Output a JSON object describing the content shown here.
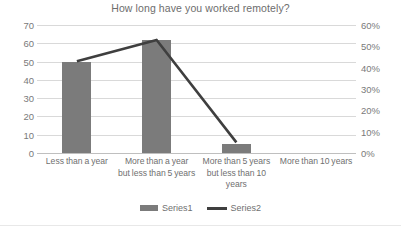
{
  "chart_data": {
    "type": "bar",
    "title": "How long have you worked remotely?",
    "xlabel": "",
    "ylabel": "",
    "categories": [
      "Less than a year",
      "More than a year but less than 5 years",
      "More than 5 years but less than 10 years",
      "More than 10 years"
    ],
    "series": [
      {
        "name": "Series1",
        "type": "bar",
        "axis": "left",
        "values": [
          50,
          62,
          5,
          0
        ]
      },
      {
        "name": "Series2",
        "type": "line",
        "axis": "right",
        "values": [
          43,
          53,
          5,
          null
        ]
      }
    ],
    "ylim": [
      0,
      70
    ],
    "y_ticks": [
      "0",
      "10",
      "20",
      "30",
      "40",
      "50",
      "60",
      "70"
    ],
    "y2lim": [
      0,
      60
    ],
    "y2_ticks": [
      "0%",
      "10%",
      "20%",
      "30%",
      "40%",
      "50%",
      "60%"
    ],
    "grid": true,
    "legend_position": "bottom",
    "colors": {
      "bar": "#7b7b7b",
      "line": "#3f3f3f",
      "grid": "#d9d9d9",
      "axis": "#bfbfbf",
      "text": "#6f6f6f",
      "background": "#ffffff"
    }
  },
  "axis_left": {
    "ticks": [
      {
        "label": "70",
        "value": 70
      },
      {
        "label": "60",
        "value": 60
      },
      {
        "label": "50",
        "value": 50
      },
      {
        "label": "40",
        "value": 40
      },
      {
        "label": "30",
        "value": 30
      },
      {
        "label": "20",
        "value": 20
      },
      {
        "label": "10",
        "value": 10
      },
      {
        "label": "0",
        "value": 0
      }
    ]
  },
  "axis_right": {
    "ticks": [
      {
        "label": "60%",
        "value": 60
      },
      {
        "label": "50%",
        "value": 50
      },
      {
        "label": "40%",
        "value": 40
      },
      {
        "label": "30%",
        "value": 30
      },
      {
        "label": "20%",
        "value": 20
      },
      {
        "label": "10%",
        "value": 10
      },
      {
        "label": "0%",
        "value": 0
      }
    ]
  },
  "categories": [
    {
      "line1": "Less than a year",
      "line2": "",
      "line3": ""
    },
    {
      "line1": "More than a year",
      "line2": "but less than 5 years",
      "line3": ""
    },
    {
      "line1": "More than 5 years",
      "line2": "but less than 10",
      "line3": "years"
    },
    {
      "line1": "More than 10 years",
      "line2": "",
      "line3": ""
    }
  ],
  "legend": {
    "entries": [
      {
        "label": "Series1",
        "marker": "bar-swatch",
        "color": "#7b7b7b"
      },
      {
        "label": "Series2",
        "marker": "line-swatch",
        "color": "#3f3f3f"
      }
    ]
  }
}
